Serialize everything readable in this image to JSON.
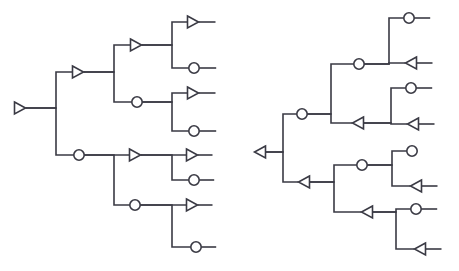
{
  "figure": {
    "title": "",
    "background_color": "#ffffff",
    "stroke_color": "#3a3a44",
    "node_fill_color": "#ffffff",
    "edge_stroke_width": 1.6,
    "node_stroke_width": 1.6,
    "width": 459,
    "height": 271,
    "node_glyphs": {
      "triangle_right": "triangle-right-outline",
      "triangle_left": "triangle-left-outline",
      "circle": "circle-outline"
    }
  },
  "diagrams": [
    {
      "id": "left-tree",
      "name": "left-binary-tree",
      "orientation": "left-to-right",
      "root_id": "L0",
      "nodes": [
        {
          "id": "L0",
          "type": "triangle_right",
          "x": 20,
          "y": 108,
          "tail": {
            "dir": "right",
            "length": 0
          }
        },
        {
          "id": "L1",
          "type": "triangle_right",
          "x": 78,
          "y": 72,
          "tail": {
            "dir": "right",
            "length": 0
          }
        },
        {
          "id": "L2",
          "type": "circle",
          "x": 79,
          "y": 155,
          "tail": {
            "dir": "right",
            "length": 0
          }
        },
        {
          "id": "L1a",
          "type": "triangle_right",
          "x": 136,
          "y": 45,
          "tail": {
            "dir": "right",
            "length": 0
          }
        },
        {
          "id": "L1b",
          "type": "circle",
          "x": 137,
          "y": 102,
          "tail": {
            "dir": "right",
            "length": 0
          }
        },
        {
          "id": "L2a",
          "type": "triangle_right",
          "x": 135,
          "y": 155,
          "tail": {
            "dir": "right",
            "length": 0
          }
        },
        {
          "id": "L2b",
          "type": "circle",
          "x": 135,
          "y": 205,
          "tail": {
            "dir": "right",
            "length": 0
          }
        },
        {
          "id": "L1a_leaf1",
          "type": "triangle_right",
          "x": 193,
          "y": 22,
          "tail": {
            "dir": "right",
            "length": 17
          }
        },
        {
          "id": "L1a_leaf2",
          "type": "circle",
          "x": 194,
          "y": 68,
          "tail": {
            "dir": "right",
            "length": 17
          }
        },
        {
          "id": "L1b_leaf1",
          "type": "triangle_right",
          "x": 193,
          "y": 93,
          "tail": {
            "dir": "right",
            "length": 17
          }
        },
        {
          "id": "L1b_leaf2",
          "type": "circle",
          "x": 194,
          "y": 131,
          "tail": {
            "dir": "right",
            "length": 17
          }
        },
        {
          "id": "L2a_leaf1",
          "type": "triangle_right",
          "x": 192,
          "y": 155,
          "tail": {
            "dir": "right",
            "length": 15
          }
        },
        {
          "id": "L2a_leaf2",
          "type": "circle",
          "x": 194,
          "y": 180,
          "tail": {
            "dir": "right",
            "length": 15
          }
        },
        {
          "id": "L2b_leaf1",
          "type": "triangle_right",
          "x": 192,
          "y": 205,
          "tail": {
            "dir": "right",
            "length": 15
          }
        },
        {
          "id": "L2b_leaf2",
          "type": "circle",
          "x": 196,
          "y": 247,
          "tail": {
            "dir": "right",
            "length": 15
          }
        }
      ],
      "edges": [
        {
          "from": "L0",
          "to": "L1",
          "bus_x": 56
        },
        {
          "from": "L0",
          "to": "L2",
          "bus_x": 56
        },
        {
          "from": "L1",
          "to": "L1a",
          "bus_x": 114
        },
        {
          "from": "L1",
          "to": "L1b",
          "bus_x": 114
        },
        {
          "from": "L2",
          "to": "L2a",
          "bus_x": 114
        },
        {
          "from": "L2",
          "to": "L2b",
          "bus_x": 114
        },
        {
          "from": "L1a",
          "to": "L1a_leaf1",
          "bus_x": 172
        },
        {
          "from": "L1a",
          "to": "L1a_leaf2",
          "bus_x": 172
        },
        {
          "from": "L1b",
          "to": "L1b_leaf1",
          "bus_x": 172
        },
        {
          "from": "L1b",
          "to": "L1b_leaf2",
          "bus_x": 172
        },
        {
          "from": "L2a",
          "to": "L2a_leaf1",
          "bus_x": 172
        },
        {
          "from": "L2a",
          "to": "L2a_leaf2",
          "bus_x": 172
        },
        {
          "from": "L2b",
          "to": "L2b_leaf1",
          "bus_x": 172
        },
        {
          "from": "L2b",
          "to": "L2b_leaf2",
          "bus_x": 172
        }
      ]
    },
    {
      "id": "right-tree",
      "name": "right-binary-tree",
      "orientation": "left-to-right",
      "root_id": "R0",
      "nodes": [
        {
          "id": "R0",
          "type": "triangle_left",
          "x": 260,
          "y": 152,
          "tail": {
            "dir": "right",
            "length": 0
          }
        },
        {
          "id": "R1",
          "type": "circle",
          "x": 302,
          "y": 114,
          "tail": {
            "dir": "right",
            "length": 0
          }
        },
        {
          "id": "R2",
          "type": "triangle_left",
          "x": 304,
          "y": 182,
          "tail": {
            "dir": "right",
            "length": 0
          }
        },
        {
          "id": "R1a",
          "type": "circle",
          "x": 359,
          "y": 64,
          "tail": {
            "dir": "right",
            "length": 0
          }
        },
        {
          "id": "R1b",
          "type": "triangle_left",
          "x": 358,
          "y": 123,
          "tail": {
            "dir": "right",
            "length": 0
          }
        },
        {
          "id": "R2a",
          "type": "circle",
          "x": 362,
          "y": 165,
          "tail": {
            "dir": "right",
            "length": 0
          }
        },
        {
          "id": "R2b",
          "type": "triangle_left",
          "x": 367,
          "y": 212,
          "tail": {
            "dir": "right",
            "length": 0
          }
        },
        {
          "id": "R1a_leaf1",
          "type": "circle",
          "x": 409,
          "y": 18,
          "tail": {
            "dir": "right",
            "length": 16
          }
        },
        {
          "id": "R1a_leaf2",
          "type": "triangle_left",
          "x": 411,
          "y": 63,
          "tail": {
            "dir": "right",
            "length": 16
          }
        },
        {
          "id": "R1b_leaf1",
          "type": "circle",
          "x": 411,
          "y": 88,
          "tail": {
            "dir": "right",
            "length": 16
          }
        },
        {
          "id": "R1b_leaf2",
          "type": "triangle_left",
          "x": 413,
          "y": 124,
          "tail": {
            "dir": "right",
            "length": 16
          }
        },
        {
          "id": "R2a_leaf1",
          "type": "circle",
          "x": 412,
          "y": 151,
          "tail": {
            "dir": "right",
            "length": 0
          }
        },
        {
          "id": "R2a_leaf2",
          "type": "triangle_left",
          "x": 416,
          "y": 186,
          "tail": {
            "dir": "right",
            "length": 16
          }
        },
        {
          "id": "R2b_leaf1",
          "type": "circle",
          "x": 416,
          "y": 209,
          "tail": {
            "dir": "right",
            "length": 16
          }
        },
        {
          "id": "R2b_leaf2",
          "type": "triangle_left",
          "x": 420,
          "y": 249,
          "tail": {
            "dir": "right",
            "length": 16
          }
        }
      ],
      "edges": [
        {
          "from": "R0",
          "to": "R1",
          "bus_x": 283
        },
        {
          "from": "R0",
          "to": "R2",
          "bus_x": 283
        },
        {
          "from": "R1",
          "to": "R1a",
          "bus_x": 331
        },
        {
          "from": "R1",
          "to": "R1b",
          "bus_x": 331
        },
        {
          "from": "R2",
          "to": "R2a",
          "bus_x": 334
        },
        {
          "from": "R2",
          "to": "R2b",
          "bus_x": 334
        },
        {
          "from": "R1a",
          "to": "R1a_leaf1",
          "bus_x": 389
        },
        {
          "from": "R1a",
          "to": "R1a_leaf2",
          "bus_x": 389
        },
        {
          "from": "R1b",
          "to": "R1b_leaf1",
          "bus_x": 391
        },
        {
          "from": "R1b",
          "to": "R1b_leaf2",
          "bus_x": 391
        },
        {
          "from": "R2a",
          "to": "R2a_leaf1",
          "bus_x": 392
        },
        {
          "from": "R2a",
          "to": "R2a_leaf2",
          "bus_x": 392
        },
        {
          "from": "R2b",
          "to": "R2b_leaf1",
          "bus_x": 396
        },
        {
          "from": "R2b",
          "to": "R2b_leaf2",
          "bus_x": 396
        }
      ]
    }
  ]
}
